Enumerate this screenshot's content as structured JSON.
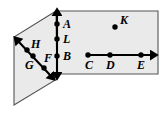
{
  "figure": {
    "width": 168,
    "height": 118,
    "background_color": "#ffffff",
    "plane_fill_color": "#eaeaea",
    "plane_stroke_color": "#555555",
    "line_color": "#000000",
    "label_color": "#000000"
  },
  "planes": [
    {
      "name": "left-plane",
      "shape": "parallelogram",
      "points": "56,11 14,37 14,105 57,79"
    },
    {
      "name": "right-plane",
      "shape": "rectangle",
      "points": "57,11 158,11 158,74 57,74"
    }
  ],
  "lines": [
    {
      "name": "vertical-line-ALB",
      "orientation": "vertical",
      "arrow_start": true,
      "arrow_end": true,
      "x1": 57,
      "y1": 14,
      "x2": 57,
      "y2": 74,
      "points_on_line": [
        "A",
        "L",
        "B"
      ]
    },
    {
      "name": "diagonal-line-HGF",
      "orientation": "diagonal",
      "arrow_start": true,
      "arrow_end": true,
      "x1": 18,
      "y1": 41,
      "x2": 51,
      "y2": 76,
      "points_on_line": [
        "H",
        "G",
        "F"
      ]
    },
    {
      "name": "horizontal-ray-CDE",
      "orientation": "horizontal",
      "arrow_start": false,
      "arrow_end": true,
      "x1": 87,
      "y1": 55,
      "x2": 152,
      "y2": 55,
      "points_on_line": [
        "C",
        "D",
        "E"
      ]
    }
  ],
  "points": [
    {
      "label": "A",
      "dot_x": 57,
      "dot_y": 24,
      "label_x": 63,
      "label_y": 28
    },
    {
      "label": "L",
      "dot_x": 57,
      "dot_y": 39,
      "label_x": 63,
      "label_y": 43
    },
    {
      "label": "B",
      "dot_x": 57,
      "dot_y": 56,
      "label_x": 63,
      "label_y": 60
    },
    {
      "label": "H",
      "dot_x": 27,
      "dot_y": 50,
      "label_x": 31,
      "label_y": 48
    },
    {
      "label": "G",
      "dot_x": 33,
      "dot_y": 56,
      "label_x": 25,
      "label_y": 69
    },
    {
      "label": "F",
      "dot_x": 44,
      "dot_y": 68,
      "label_x": 44,
      "label_y": 62
    },
    {
      "label": "K",
      "dot_x": 115,
      "dot_y": 27,
      "label_x": 120,
      "label_y": 24
    },
    {
      "label": "C",
      "dot_x": 88,
      "dot_y": 55,
      "label_x": 85,
      "label_y": 69
    },
    {
      "label": "D",
      "dot_x": 110,
      "dot_y": 55,
      "label_x": 106,
      "label_y": 69
    },
    {
      "label": "E",
      "dot_x": 141,
      "dot_y": 55,
      "label_x": 137,
      "label_y": 69
    }
  ]
}
